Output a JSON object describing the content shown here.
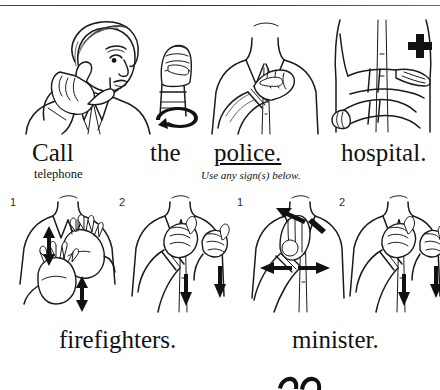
{
  "page": {
    "background_color": "#ffffff",
    "ink_color": "#111111",
    "rule_color": "#3a3a3a"
  },
  "rows": {
    "top": {
      "panels": [
        {
          "id": "call",
          "word": "Call",
          "caption": "telephone",
          "illustration": "man-holding-y-hand-to-ear-telephone-sign",
          "underlined": false
        },
        {
          "id": "the",
          "word": "the",
          "caption": "",
          "illustration": "fist-with-circular-rotation-arrow",
          "underlined": false
        },
        {
          "id": "police",
          "word": "police.",
          "caption": "Use any sign(s) below.",
          "illustration": "hand-c-shape-tapping-shoulder-badge",
          "underlined": true
        },
        {
          "id": "hospital",
          "word": "hospital.",
          "caption": "",
          "illustration": "hand-drawing-cross-on-upper-arm",
          "underlined": false
        }
      ]
    },
    "bottom": {
      "groups": [
        {
          "id": "firefighters",
          "word": "firefighters.",
          "steps": [
            {
              "number": "1",
              "illustration": "two-open-hands-moving-vertically-at-chest"
            },
            {
              "number": "2",
              "illustration": "two-fists-thumbs-up-moving-down"
            }
          ]
        },
        {
          "id": "minister",
          "word": "minister.",
          "steps": [
            {
              "number": "1",
              "illustration": "f-hand-at-chest-with-side-arrows"
            },
            {
              "number": "2",
              "illustration": "two-fists-thumbs-up-moving-down"
            }
          ]
        }
      ]
    },
    "footer": {
      "illustration": "partial-hand-top-cut-off-at-page-edge"
    }
  }
}
